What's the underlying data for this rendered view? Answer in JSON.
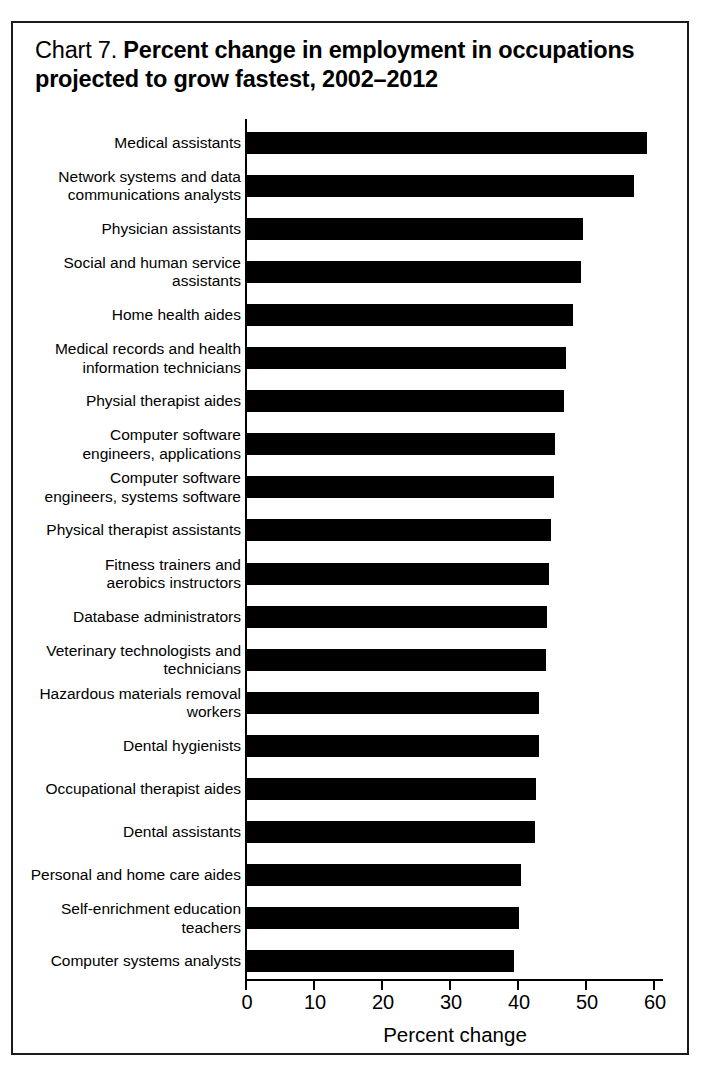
{
  "figure": {
    "label_prefix": "Chart 7.",
    "title": "Percent change in employment in occupations projected to grow fastest, 2002–2012"
  },
  "chart_data": {
    "type": "bar",
    "orientation": "horizontal",
    "title": "Chart 7. Percent change in employment in occupations projected to grow fastest, 2002–2012",
    "xlabel": "Percent change",
    "ylabel": "",
    "xlim": [
      0,
      60
    ],
    "xticks": [
      0,
      10,
      20,
      30,
      40,
      50,
      60
    ],
    "xtick_labels": [
      "0",
      "10",
      "20",
      "30",
      "40",
      "50",
      "60"
    ],
    "grid": false,
    "legend": false,
    "bar_color": "#000000",
    "categories": [
      "Medical assistants",
      "Network systems and data\ncommunications analysts",
      "Physician assistants",
      "Social and human service\nassistants",
      "Home health aides",
      "Medical records and health\ninformation technicians",
      "Physial therapist aides",
      "Computer software\nengineers, applications",
      "Computer software\nengineers, systems software",
      "Physical therapist assistants",
      "Fitness trainers and\naerobics instructors",
      "Database administrators",
      "Veterinary technologists and\ntechnicians",
      "Hazardous materials removal\nworkers",
      "Dental hygienists",
      "Occupational therapist aides",
      "Dental assistants",
      "Personal and home care aides",
      "Self-enrichment education\nteachers",
      "Computer systems analysts"
    ],
    "values": [
      59.0,
      57.0,
      49.6,
      49.2,
      48.1,
      47.1,
      46.8,
      45.5,
      45.3,
      44.8,
      44.5,
      44.2,
      44.1,
      43.1,
      43.1,
      42.6,
      42.5,
      40.5,
      40.2,
      39.4
    ]
  }
}
